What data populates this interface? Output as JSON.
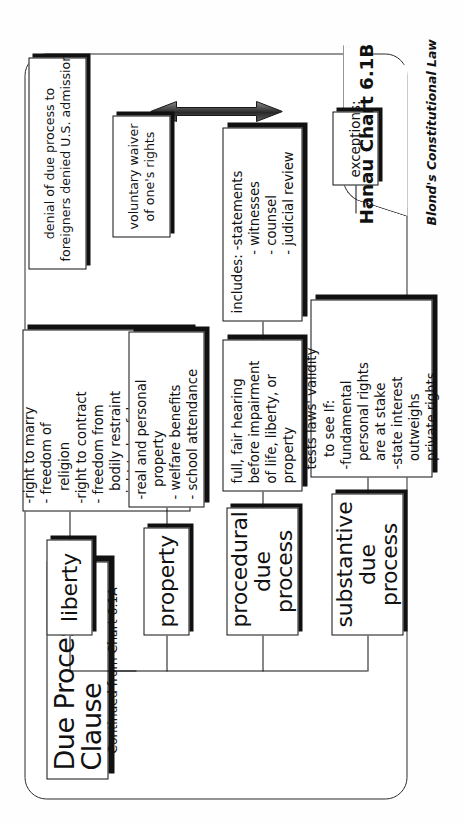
{
  "page": {
    "title": "Due Process Clause",
    "subtitle": "Continued from Chart 6.1A",
    "chart_id": "Hanau Chart 6.1B",
    "brand": "Blond's Constitutional Law"
  },
  "branches": [
    {
      "key": "liberty",
      "label": "liberty",
      "detail": "-right to marry\n- freedom of\n   religion\n-right to contract\n- freedom from\n   bodily restraint\n-right to lawful\n   occupation\n-right against self-\n   incrimination"
    },
    {
      "key": "property",
      "label": "property",
      "detail": "-real and personal\n   property\n- welfare benefits\n- school attendance"
    },
    {
      "key": "procedural-due-process",
      "label": "procedural\ndue process",
      "detail": "full, fair hearing\nbefore impairment\nof life, liberty, or\nproperty",
      "detail2": "includes: -statements\n              - witnesses\n              - counsel\n              - judicial review"
    },
    {
      "key": "substantive-due-process",
      "label": "substantive\ndue process",
      "detail": "tests laws' validity\n   to see If:\n-fundamental\n  personal rights\n  are at stake\n-state interest\n  outweighs\n  private rights"
    }
  ],
  "exceptions": {
    "label": "exceptions:",
    "items": [
      "voluntary waiver\nof one's rights",
      "denial of due process to\nforeigners denied U.S. admission"
    ]
  },
  "icons": {
    "arrow": "double-headed-vertical-arrow"
  },
  "colors": {
    "ink": "#111111",
    "paper": "#ffffff"
  }
}
